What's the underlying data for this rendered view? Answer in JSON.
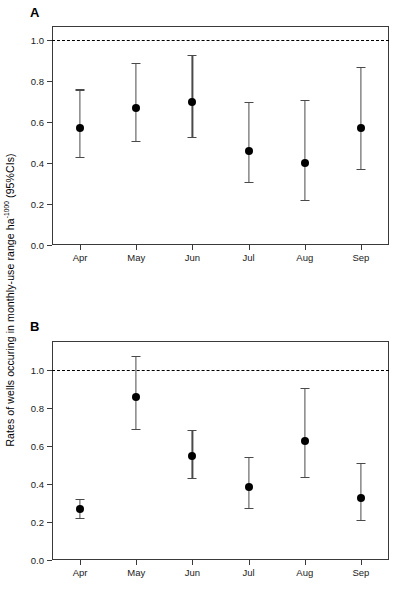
{
  "figure": {
    "y_axis_title_main": "Rates of wells occuring in monthly-use range ha",
    "y_axis_title_sup": "-1000",
    "y_axis_title_tail": " (95%CIs)"
  },
  "chart_data": [
    {
      "type": "scatter",
      "panel": "A",
      "title": "",
      "xlabel": "",
      "ylabel": "Rates of wells occuring in monthly-use range ha-1000 (95%CIs)",
      "categories": [
        "Apr",
        "May",
        "Jun",
        "Jul",
        "Aug",
        "Sep"
      ],
      "values": [
        0.57,
        0.67,
        0.7,
        0.46,
        0.4,
        0.57
      ],
      "ci_lower": [
        0.43,
        0.51,
        0.53,
        0.31,
        0.22,
        0.37
      ],
      "ci_upper": [
        0.76,
        0.89,
        0.93,
        0.7,
        0.71,
        0.87
      ],
      "ylim": [
        0.0,
        1.07
      ],
      "yticks": [
        "0.0",
        "0.2",
        "0.4",
        "0.6",
        "0.8",
        "1.0"
      ],
      "ytick_values": [
        0.0,
        0.2,
        0.4,
        0.6,
        0.8,
        1.0
      ],
      "reference_line": 1.0,
      "reference_line_style": "dashed",
      "grid": false,
      "legend": "none",
      "marker": "filled-circle",
      "errorbar_style": "capped"
    },
    {
      "type": "scatter",
      "panel": "B",
      "title": "",
      "xlabel": "",
      "ylabel": "Rates of wells occuring in monthly-use range ha-1000 (95%CIs)",
      "categories": [
        "Apr",
        "May",
        "Jun",
        "Jul",
        "Aug",
        "Sep"
      ],
      "values": [
        0.27,
        0.855,
        0.545,
        0.385,
        0.625,
        0.325
      ],
      "ci_lower": [
        0.22,
        0.69,
        0.43,
        0.275,
        0.435,
        0.21
      ],
      "ci_upper": [
        0.32,
        1.07,
        0.685,
        0.54,
        0.905,
        0.51
      ],
      "ylim": [
        0.0,
        1.15
      ],
      "yticks": [
        "0.0",
        "0.2",
        "0.4",
        "0.6",
        "0.8",
        "1.0"
      ],
      "ytick_values": [
        0.0,
        0.2,
        0.4,
        0.6,
        0.8,
        1.0
      ],
      "reference_line": 1.0,
      "reference_line_style": "dashed",
      "grid": false,
      "legend": "none",
      "marker": "filled-circle",
      "errorbar_style": "capped"
    }
  ],
  "panels": [
    {
      "letter": "A"
    },
    {
      "letter": "B"
    }
  ]
}
